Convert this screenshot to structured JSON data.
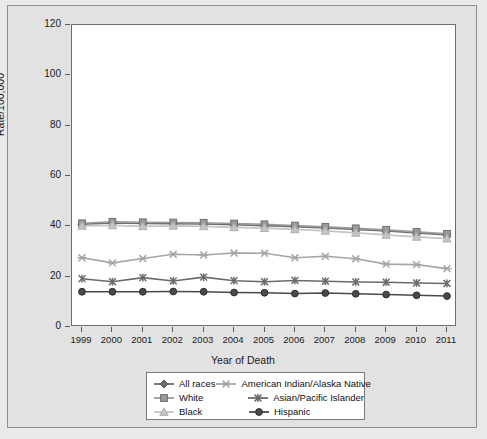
{
  "chart_data": {
    "type": "line",
    "title": "",
    "xlabel": "Year of Death",
    "ylabel": "Rate/100,000",
    "x": [
      1999,
      2000,
      2001,
      2002,
      2003,
      2004,
      2005,
      2006,
      2007,
      2008,
      2009,
      2010,
      2011
    ],
    "xtick_labels": [
      "1999",
      "2000",
      "2001",
      "2002",
      "2003",
      "2004",
      "2005",
      "2006",
      "2007",
      "2008",
      "2009",
      "2010",
      "2011"
    ],
    "ytick_labels": [
      "0",
      "20",
      "40",
      "60",
      "80",
      "100",
      "120"
    ],
    "ytick_values": [
      0,
      20,
      40,
      60,
      80,
      100,
      120
    ],
    "ylim": [
      0,
      120
    ],
    "grid": false,
    "legend_position": "below-center",
    "legend_columns": 2,
    "series": [
      {
        "name": "All races",
        "marker": "diamond",
        "color": "#6d6d6d",
        "values": [
          40.8,
          41.3,
          41.1,
          41.0,
          40.9,
          40.6,
          40.3,
          39.9,
          39.4,
          38.8,
          38.2,
          37.4,
          36.6
        ]
      },
      {
        "name": "White",
        "marker": "square",
        "color": "#9a9a9a",
        "values": [
          41.2,
          41.8,
          41.6,
          41.5,
          41.4,
          41.1,
          40.8,
          40.3,
          39.8,
          39.2,
          38.6,
          37.8,
          37.0
        ]
      },
      {
        "name": "Black",
        "marker": "triangle",
        "color": "#c4c4c4",
        "values": [
          40.2,
          40.4,
          40.0,
          40.2,
          40.0,
          39.6,
          39.3,
          38.8,
          38.2,
          37.4,
          36.6,
          35.8,
          35.1
        ]
      },
      {
        "name": "American Indian/Alaska Native",
        "marker": "x",
        "color": "#a5a5a5",
        "values": [
          27.5,
          25.5,
          27.2,
          28.9,
          28.6,
          29.4,
          29.3,
          27.5,
          28.1,
          27.1,
          25.0,
          24.8,
          23.2
        ]
      },
      {
        "name": "Asian/Pacific Islander",
        "marker": "star",
        "color": "#6a6a6a",
        "values": [
          19.2,
          18.0,
          19.6,
          18.3,
          19.8,
          18.4,
          18.0,
          18.5,
          18.2,
          17.9,
          17.8,
          17.5,
          17.3
        ]
      },
      {
        "name": "Hispanic",
        "marker": "circle",
        "color": "#4a4a4a",
        "values": [
          14.0,
          14.0,
          14.0,
          14.1,
          14.0,
          13.7,
          13.6,
          13.3,
          13.5,
          13.2,
          12.9,
          12.6,
          12.3
        ]
      }
    ]
  }
}
